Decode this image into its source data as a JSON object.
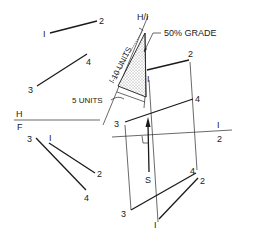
{
  "diagram": {
    "type": "descriptive-geometry",
    "annotations": {
      "grade": "50% GRADE",
      "ten_units": "10 UNITS",
      "five_units": "5 UNITS",
      "fold_hf_top": "H",
      "fold_hf_bottom": "F",
      "fold_h1": "H/I",
      "fold_12_top": "I",
      "fold_12_bottom": "2",
      "view_direction": "S"
    },
    "top_view": {
      "line12": {
        "p1": "I",
        "p2": "2"
      },
      "line34": {
        "p3": "3",
        "p4": "4"
      }
    },
    "front_view": {
      "line12": {
        "p1": "I",
        "p2": "2"
      },
      "line34": {
        "p3": "3",
        "p4": "4"
      }
    },
    "aux_view_1": {
      "line12": {
        "p1": "I",
        "p2": "2"
      },
      "line34": {
        "p3": "3",
        "p4": "4"
      }
    },
    "aux_view_2": {
      "line12": {
        "p1": "I",
        "p2": "2"
      },
      "line34": {
        "p3": "3",
        "p4": "4"
      }
    }
  }
}
